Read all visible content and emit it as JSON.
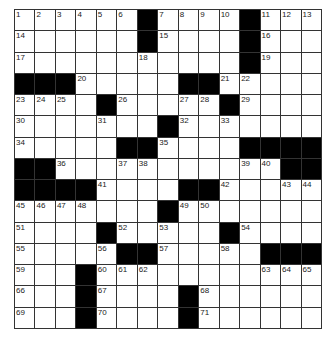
{
  "puzzle": {
    "rows": 15,
    "cols": 15,
    "colors": {
      "black": "#000000",
      "white": "#ffffff",
      "line": "#333333"
    },
    "grid": [
      [
        "1",
        "2",
        "3",
        "4",
        "5",
        "6",
        "#",
        "7",
        "8",
        "9",
        "10",
        "#",
        "11",
        "12",
        "13"
      ],
      [
        "14",
        "",
        "",
        "",
        "",
        "",
        "#",
        "15",
        "",
        "",
        "",
        "#",
        "16",
        "",
        ""
      ],
      [
        "17",
        "",
        "",
        "",
        "",
        "",
        "18",
        "",
        "",
        "",
        "",
        "#",
        "19",
        "",
        ""
      ],
      [
        "#",
        "#",
        "#",
        "20",
        "",
        "",
        "",
        "",
        "#",
        "#",
        "21",
        "22",
        "",
        "",
        ""
      ],
      [
        "23",
        "24",
        "25",
        "",
        "#",
        "26",
        "",
        "",
        "27",
        "28",
        "#",
        "29",
        "",
        "",
        ""
      ],
      [
        "30",
        "",
        "",
        "",
        "31",
        "",
        "",
        "#",
        "32",
        "",
        "33",
        "",
        "",
        "",
        ""
      ],
      [
        "34",
        "",
        "",
        "",
        "",
        "#",
        "#",
        "35",
        "",
        "",
        "",
        "#",
        "#",
        "#",
        "#"
      ],
      [
        "#",
        "#",
        "36",
        "",
        "",
        "37",
        "38",
        "",
        "",
        "",
        "",
        "39",
        "40",
        "#",
        "#"
      ],
      [
        "#",
        "#",
        "#",
        "#",
        "41",
        "",
        "",
        "",
        "#",
        "#",
        "42",
        "",
        "",
        "43",
        "44"
      ],
      [
        "45",
        "46",
        "47",
        "48",
        "",
        "",
        "",
        "#",
        "49",
        "50",
        "",
        "",
        "",
        "",
        ""
      ],
      [
        "51",
        "",
        "",
        "",
        "#",
        "52",
        "",
        "53",
        "",
        "",
        "#",
        "54",
        "",
        "",
        ""
      ],
      [
        "55",
        "",
        "",
        "",
        "56",
        "#",
        "#",
        "57",
        "",
        "",
        "58",
        "",
        "#",
        "#",
        "#"
      ],
      [
        "59",
        "",
        "",
        "#",
        "60",
        "61",
        "62",
        "",
        "",
        "",
        "",
        "",
        "63",
        "64",
        "65"
      ],
      [
        "66",
        "",
        "",
        "#",
        "67",
        "",
        "",
        "",
        "#",
        "68",
        "",
        "",
        "",
        "",
        ""
      ],
      [
        "69",
        "",
        "",
        "#",
        "70",
        "",
        "",
        "",
        "#",
        "71",
        "",
        "",
        "",
        "",
        ""
      ]
    ]
  }
}
